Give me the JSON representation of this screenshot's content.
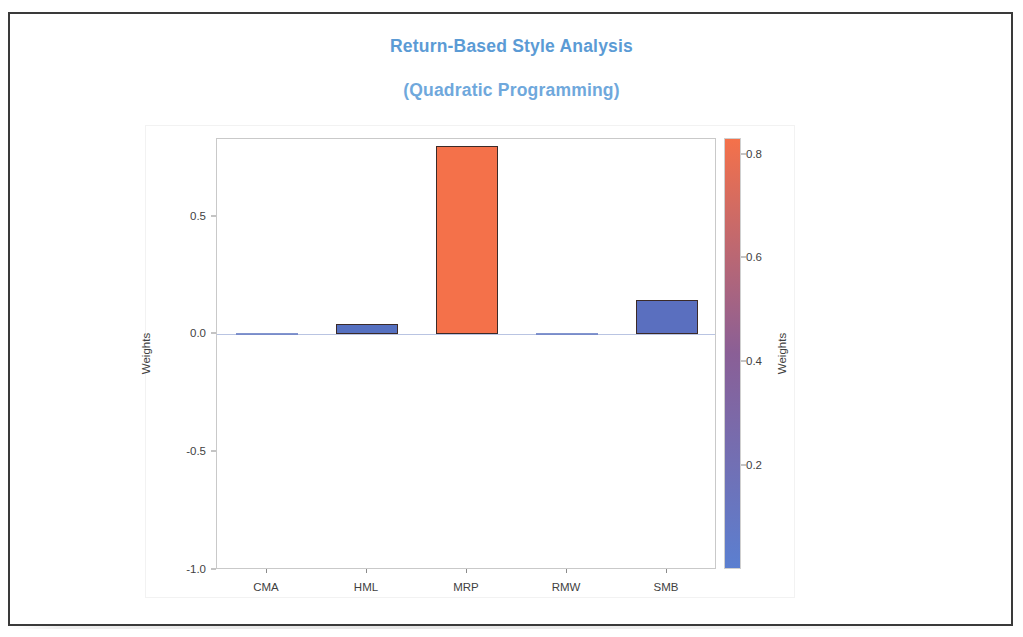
{
  "page": {
    "border_color": "#3a3a3a",
    "background": "#ffffff"
  },
  "title": {
    "line1": "Return-Based Style Analysis",
    "line2": "(Quadratic Programming)",
    "color": "#5b9bd5"
  },
  "chart_data": {
    "type": "bar",
    "title": "Return-Based Style Analysis (Quadratic Programming)",
    "categories": [
      "CMA",
      "HML",
      "MRP",
      "RMW",
      "SMB"
    ],
    "values": [
      0.0,
      0.045,
      0.8,
      0.0,
      0.145
    ],
    "bar_colors": [
      "#6d83c6",
      "#5570c0",
      "#f4714a",
      "#6d83c6",
      "#5a6fbf"
    ],
    "bar_edge_color": "#3b2a28",
    "xlabel": "",
    "ylabel": "Weights",
    "ylim": [
      -1.0,
      0.83
    ],
    "yticks": [
      0.5,
      0.0,
      -0.5,
      -1.0
    ],
    "ytick_labels": [
      "0.5",
      "0.0",
      "-0.5",
      "-1.0"
    ],
    "grid": false,
    "zero_line_color": "#b9c4e2",
    "colorbar": {
      "label": "Weights",
      "ticks": [
        0.8,
        0.6,
        0.4,
        0.2
      ],
      "tick_labels": [
        "0.8",
        "0.6",
        "0.4",
        "0.2"
      ],
      "vmin": 0.0,
      "vmax": 0.83,
      "low_color": "#5b7fd0",
      "mid_color": "#8a5f96",
      "high_color": "#f4714a",
      "position": "right"
    }
  }
}
